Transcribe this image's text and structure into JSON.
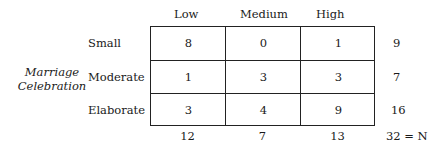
{
  "table": {
    "row_variable": "Marriage Celebration",
    "row_variable_lines": [
      "Marriage",
      "Celebration"
    ],
    "columns": [
      "Low",
      "Medium",
      "High"
    ],
    "rows": [
      {
        "label": "Small",
        "values": [
          "8",
          "0",
          "1"
        ],
        "total": "9"
      },
      {
        "label": "Moderate",
        "values": [
          "1",
          "3",
          "3"
        ],
        "total": "7"
      },
      {
        "label": "Elaborate",
        "values": [
          "3",
          "4",
          "9"
        ],
        "total": "16"
      }
    ],
    "column_totals": [
      "12",
      "7",
      "13"
    ],
    "grand_total": "32 = N"
  }
}
